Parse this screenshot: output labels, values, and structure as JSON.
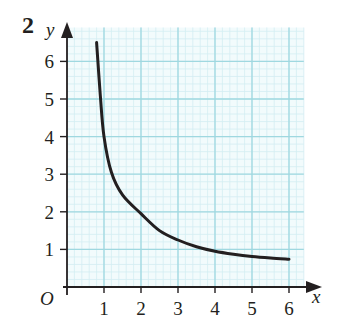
{
  "question_number": "2",
  "chart_data": {
    "type": "line",
    "title": "",
    "xlabel": "x",
    "ylabel": "y",
    "origin_label": "O",
    "xlim": [
      0,
      6.5
    ],
    "ylim": [
      0,
      6.8
    ],
    "x_ticks": [
      1,
      2,
      3,
      4,
      5,
      6
    ],
    "y_ticks": [
      1,
      2,
      3,
      4,
      5,
      6
    ],
    "x_tick_labels": [
      "1",
      "2",
      "3",
      "4",
      "5",
      "6"
    ],
    "y_tick_labels": [
      "1",
      "2",
      "3",
      "4",
      "5",
      "6"
    ],
    "grid": true,
    "grid_minor_per_unit": 5,
    "legend": null,
    "series": [
      {
        "name": "curve",
        "x": [
          0.8,
          0.9,
          1.0,
          1.2,
          1.5,
          2.0,
          2.5,
          3.0,
          3.5,
          4.0,
          4.5,
          5.0,
          5.5,
          6.0
        ],
        "y": [
          6.5,
          5.1,
          4.0,
          3.05,
          2.45,
          1.95,
          1.5,
          1.25,
          1.07,
          0.95,
          0.87,
          0.81,
          0.77,
          0.74
        ]
      }
    ],
    "colors": {
      "grid_major": "#9fd8e0",
      "grid_minor": "#d3eef2",
      "background": "#f2fbfc",
      "axis": "#231f20",
      "curve": "#231f20"
    }
  }
}
